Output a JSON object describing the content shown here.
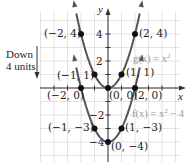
{
  "chart_data": {
    "type": "line",
    "title": "",
    "xlabel": "x",
    "ylabel": "y",
    "xlim": [
      -5,
      5
    ],
    "ylim": [
      -5,
      6
    ],
    "grid": true,
    "y_ticks": [
      2,
      4,
      -2,
      -4
    ],
    "y_tick_labels": [
      "2",
      "4",
      "−2",
      "−4"
    ],
    "series": [
      {
        "name": "g(x) = x²",
        "label": "g(x) = x",
        "label_exp": "2",
        "function": "x^2",
        "points": [
          {
            "x": -2,
            "y": 4,
            "label": "(−2, 4)"
          },
          {
            "x": -1,
            "y": 1,
            "label": "(−1, 1)"
          },
          {
            "x": 0,
            "y": 0,
            "label": "(0, 0)"
          },
          {
            "x": 1,
            "y": 1,
            "label": "(1, 1)"
          },
          {
            "x": 2,
            "y": 4,
            "label": "(2, 4)"
          }
        ]
      },
      {
        "name": "f(x) = x² − 4",
        "label": "f(x) = x",
        "label_exp": "2",
        "label_tail": " − 4",
        "function": "x^2 - 4",
        "points": [
          {
            "x": -2,
            "y": 0,
            "label": "(−2, 0)"
          },
          {
            "x": -1,
            "y": -3,
            "label": "(−1, −3)"
          },
          {
            "x": 0,
            "y": -4,
            "label": "(0, −4)"
          },
          {
            "x": 1,
            "y": -3,
            "label": "(1, −3)"
          },
          {
            "x": 2,
            "y": 0,
            "label": "(2, 0)"
          }
        ]
      }
    ],
    "annotations": [
      {
        "text_line1": "Down",
        "text_line2": "4 units",
        "arrow": "down"
      }
    ]
  },
  "labels": {
    "axis_x": "x",
    "axis_y": "y",
    "tick_4": "4",
    "tick_2": "2",
    "tick_m2": "−2",
    "tick_m4": "−4",
    "g_label": "g(x) = x",
    "g_exp": "2",
    "f_label": "f(x) = x",
    "f_exp": "2",
    "f_tail": " − 4",
    "down_line1": "Down",
    "down_line2": "4 units",
    "pt_m2_4": "(−2, 4)",
    "pt_m1_1": "(−1, 1)",
    "pt_0_0": "(0, 0)",
    "pt_1_1": "(1, 1)",
    "pt_2_4": "(2, 4)",
    "pt_m2_0": "(−2, 0)",
    "pt_2_0": "(2, 0)",
    "pt_m1_m3": "(−1, −3)",
    "pt_1_m3": "(1, −3)",
    "pt_0_m4": "(0, −4)"
  },
  "colors": {
    "curve": "#555555",
    "point": "#111111",
    "grid": "#dcdcdc",
    "axis": "#333333"
  }
}
